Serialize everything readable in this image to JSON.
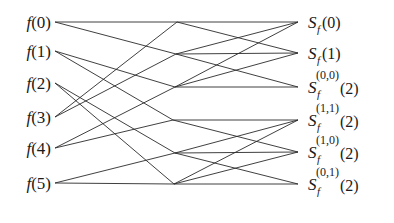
{
  "diagram": {
    "type": "butterfly-flow-graph",
    "stroke_color": "#2a2a2a",
    "text_color": "#1a1a1a",
    "inputs": [
      {
        "name": "f",
        "arg": "(0)",
        "x": 55,
        "y": 22
      },
      {
        "name": "f",
        "arg": "(1)",
        "x": 55,
        "y": 51
      },
      {
        "name": "f",
        "arg": "(2)",
        "x": 55,
        "y": 83
      },
      {
        "name": "f",
        "arg": "(3)",
        "x": 55,
        "y": 117
      },
      {
        "name": "f",
        "arg": "(4)",
        "x": 55,
        "y": 148
      },
      {
        "name": "f",
        "arg": "(5)",
        "x": 55,
        "y": 183
      }
    ],
    "middle_nodes": [
      {
        "x": 177,
        "y": 22
      },
      {
        "x": 176,
        "y": 54
      },
      {
        "x": 175,
        "y": 87
      },
      {
        "x": 173,
        "y": 120
      },
      {
        "x": 175,
        "y": 153
      },
      {
        "x": 174,
        "y": 184
      }
    ],
    "outputs": [
      {
        "base": "S",
        "sub": "f",
        "sup": "",
        "arg": "(0)",
        "x": 298,
        "y": 22
      },
      {
        "base": "S",
        "sub": "f",
        "sup": "",
        "arg": "(1)",
        "x": 298,
        "y": 53
      },
      {
        "base": "S",
        "sub": "f",
        "sup": "(0,0)",
        "arg": "(2)",
        "x": 298,
        "y": 87
      },
      {
        "base": "S",
        "sub": "f",
        "sup": "(1,1)",
        "arg": "(2)",
        "x": 298,
        "y": 120
      },
      {
        "base": "S",
        "sub": "f",
        "sup": "(1,0)",
        "arg": "(2)",
        "x": 298,
        "y": 152
      },
      {
        "base": "S",
        "sub": "f",
        "sup": "(0,1)",
        "arg": "(2)",
        "x": 298,
        "y": 184
      }
    ],
    "stage1_edges": [
      [
        0,
        0
      ],
      [
        0,
        1
      ],
      [
        1,
        2
      ],
      [
        1,
        3
      ],
      [
        2,
        4
      ],
      [
        2,
        5
      ],
      [
        3,
        0
      ],
      [
        3,
        1
      ],
      [
        4,
        2
      ],
      [
        4,
        3
      ],
      [
        5,
        4
      ],
      [
        5,
        5
      ]
    ],
    "stage2_edges": [
      [
        0,
        0
      ],
      [
        0,
        1
      ],
      [
        1,
        0
      ],
      [
        1,
        1
      ],
      [
        1,
        2
      ],
      [
        2,
        0
      ],
      [
        2,
        1
      ],
      [
        2,
        2
      ],
      [
        3,
        3
      ],
      [
        3,
        4
      ],
      [
        4,
        3
      ],
      [
        4,
        4
      ],
      [
        4,
        5
      ],
      [
        5,
        3
      ],
      [
        5,
        4
      ],
      [
        5,
        5
      ]
    ]
  }
}
